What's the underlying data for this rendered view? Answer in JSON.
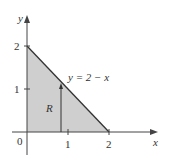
{
  "diagram": {
    "axes": {
      "x_label": "x",
      "y_label": "y",
      "origin_label": "0"
    },
    "x_ticks": [
      "1",
      "2"
    ],
    "y_ticks": [
      "1",
      "2"
    ],
    "curve_label": "y = 2 − x",
    "region_label": "R",
    "colors": {
      "region_fill": "#cfcfcf",
      "axis": "#444444",
      "line": "#333333"
    }
  }
}
